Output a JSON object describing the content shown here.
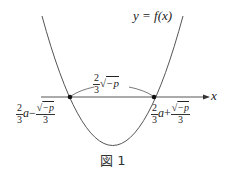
{
  "figure": {
    "curve_label": "y = f(x)",
    "axis_label": "x",
    "distance_label": {
      "num": "2",
      "den": "3",
      "root": "−p"
    },
    "left_root": {
      "coef_num": "2",
      "coef_den": "3",
      "var": "a",
      "sign": "−",
      "root": "−p",
      "den": "3"
    },
    "right_root": {
      "coef_num": "2",
      "coef_den": "3",
      "var": "a",
      "sign": "+",
      "root": "−p",
      "den": "3"
    },
    "caption": "図 1"
  }
}
